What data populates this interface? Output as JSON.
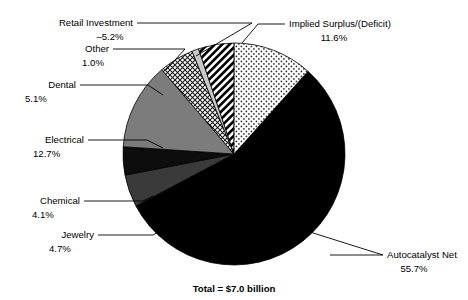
{
  "chart_data": {
    "type": "pie",
    "title": "",
    "subtitle": "",
    "total_label": "Total = $7.0 billion",
    "legend_position": "callout-labels",
    "grid": false,
    "units": "percent of $7.0 billion",
    "categories": [
      "Autocatalyst Net",
      "Jewelry",
      "Chemical",
      "Electrical",
      "Dental",
      "Other",
      "Retail Investment",
      "Implied Surplus/(Deficit)"
    ],
    "values": [
      55.7,
      4.7,
      4.1,
      12.7,
      5.1,
      1.0,
      -5.2,
      11.6
    ],
    "slices": [
      {
        "name": "Autocatalyst Net",
        "label": "Autocatalyst Net",
        "value_label": "55.7%",
        "value": 55.7,
        "fill": "solid-black",
        "color": "#000000",
        "start_angle": 41.8,
        "end_angle": 242.3
      },
      {
        "name": "Jewelry",
        "label": "Jewelry",
        "value_label": "4.7%",
        "value": 4.7,
        "fill": "solid-dark-gray",
        "color": "#3a3a3a",
        "start_angle": 242.3,
        "end_angle": 259.2
      },
      {
        "name": "Chemical",
        "label": "Chemical",
        "value_label": "4.1%",
        "value": 4.1,
        "fill": "solid-black",
        "color": "#0d0d0d",
        "start_angle": 259.2,
        "end_angle": 273.9
      },
      {
        "name": "Electrical",
        "label": "Electrical",
        "value_label": "12.7%",
        "value": 12.7,
        "fill": "solid-medium-gray",
        "color": "#7c7c7c",
        "start_angle": 273.9,
        "end_angle": 319.6
      },
      {
        "name": "Dental",
        "label": "Dental",
        "value_label": "5.1%",
        "value": 5.1,
        "fill": "crosshatch",
        "color": "#ffffff",
        "start_angle": 319.6,
        "end_angle": 337.9
      },
      {
        "name": "Other",
        "label": "Other",
        "value_label": "1.0%",
        "value": 1.0,
        "fill": "light-gray",
        "color": "#c8c8c8",
        "start_angle": 337.9,
        "end_angle": 341.5
      },
      {
        "name": "Retail Investment",
        "label": "Retail Investment",
        "value_label": "–5.2%",
        "value": -5.2,
        "fill": "diagonal-stripes",
        "color": "#ffffff",
        "start_angle": 341.5,
        "end_angle": 360.2
      },
      {
        "name": "Implied Surplus/(Deficit)",
        "label": "Implied Surplus/(Deficit)",
        "value_label": "11.6%",
        "value": 11.6,
        "fill": "fine-dots",
        "color": "#ffffff",
        "start_angle": 360.2,
        "end_angle": 401.8
      }
    ]
  },
  "labels": {
    "retail_investment": {
      "name": "Retail Investment",
      "value": "–5.2%"
    },
    "other": {
      "name": "Other",
      "value": "1.0%"
    },
    "dental": {
      "name": "Dental",
      "value": "5.1%"
    },
    "electrical": {
      "name": "Electrical",
      "value": "12.7%"
    },
    "chemical": {
      "name": "Chemical",
      "value": "4.1%"
    },
    "jewelry": {
      "name": "Jewelry",
      "value": "4.7%"
    },
    "autocatalyst": {
      "name": "Autocatalyst Net",
      "value": "55.7%"
    },
    "implied_surplus": {
      "name": "Implied Surplus/(Deficit)",
      "value": "11.6%"
    },
    "total": "Total = $7.0 billion"
  }
}
